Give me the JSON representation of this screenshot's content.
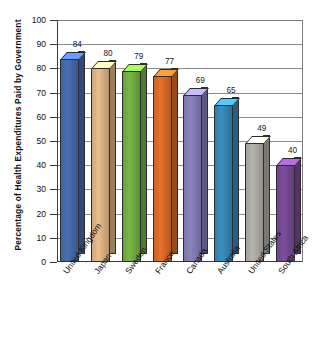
{
  "chart_data": {
    "type": "bar",
    "title": "",
    "subtitle": "",
    "xlabel": "",
    "ylabel": "Percentage of Health Expenditures Paid by Government",
    "categories": [
      "United Kingdom",
      "Japan",
      "Sweden",
      "France",
      "Canada",
      "Australia",
      "United States",
      "South Africa"
    ],
    "values": [
      84,
      80,
      79,
      77,
      69,
      65,
      49,
      40
    ],
    "value_labels": [
      "84",
      "80",
      "79",
      "77",
      "69",
      "65",
      "49",
      "40"
    ],
    "ylim": [
      0,
      100
    ],
    "ytick_labels": [
      "100",
      "90",
      "80",
      "70",
      "60",
      "50",
      "40",
      "30",
      "20",
      "10",
      "0"
    ],
    "ytick_values": [
      100,
      90,
      80,
      70,
      60,
      50,
      40,
      30,
      20,
      10,
      0
    ],
    "grid": true,
    "grid_axis": "y",
    "legend": false,
    "legend_position": "none",
    "style": "3d-bar",
    "colors": {
      "united_kingdom": "#4a6fb5",
      "japan": "#e9bd8c",
      "sweden": "#77b745",
      "france": "#e8702a",
      "canada": "#8b85bf",
      "australia": "#3b8fc4",
      "united_states": "#b7b6ae",
      "south_africa": "#7d4e9e"
    },
    "series": [
      {
        "name": "Percentage of Health Expenditures Paid by Government",
        "values": [
          84,
          80,
          79,
          77,
          69,
          65,
          49,
          40
        ]
      }
    ],
    "points": [
      {
        "category": "United Kingdom",
        "value": 84,
        "color": "#4a6fb5"
      },
      {
        "category": "Japan",
        "value": 80,
        "color": "#e9bd8c"
      },
      {
        "category": "Sweden",
        "value": 79,
        "color": "#77b745"
      },
      {
        "category": "France",
        "value": 77,
        "color": "#e8702a"
      },
      {
        "category": "Canada",
        "value": 69,
        "color": "#8b85bf"
      },
      {
        "category": "Australia",
        "value": 65,
        "color": "#3b8fc4"
      },
      {
        "category": "United States",
        "value": 49,
        "color": "#b7b6ae"
      },
      {
        "category": "South Africa",
        "value": 40,
        "color": "#7d4e9e"
      }
    ]
  }
}
